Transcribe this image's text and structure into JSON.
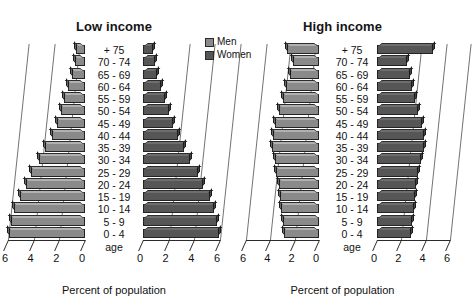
{
  "legend": {
    "items": [
      {
        "label": "Men",
        "color": "#8a8a8a"
      },
      {
        "label": "Women",
        "color": "#565656"
      }
    ]
  },
  "age_caption": "age",
  "axis_title": "Percent of population",
  "chart_data": {
    "type": "bar",
    "subtype": "population-pyramid",
    "xlabel": "Percent of population",
    "ylabel": "age",
    "xlim": [
      0,
      6
    ],
    "xticks": [
      6,
      4,
      2,
      0,
      0,
      2,
      4,
      6
    ],
    "grid": true,
    "legend_position": "top-center",
    "categories": [
      "+ 75",
      "70 - 74",
      "65 - 69",
      "60 - 64",
      "55 - 59",
      "50 - 54",
      "45 - 49",
      "40 - 44",
      "35 - 39",
      "30 - 34",
      "25 - 29",
      "20 - 24",
      "15 - 19",
      "10 - 14",
      "5 - 9",
      "0 - 4"
    ],
    "panels": [
      {
        "title": "Low income",
        "ticks_left": [
          6,
          4,
          2,
          0
        ],
        "ticks_right": [
          0,
          2,
          4,
          6
        ],
        "series": [
          {
            "name": "Men",
            "side": "left",
            "values": [
              0.7,
              0.8,
              1.0,
              1.3,
              1.6,
              1.9,
              2.2,
              2.6,
              3.1,
              3.6,
              4.2,
              4.6,
              5.1,
              5.5,
              5.8,
              5.9
            ]
          },
          {
            "name": "Women",
            "side": "right",
            "values": [
              0.8,
              0.9,
              1.1,
              1.4,
              1.7,
              2.0,
              2.3,
              2.7,
              3.2,
              3.7,
              4.3,
              4.7,
              5.2,
              5.5,
              5.8,
              5.9
            ]
          }
        ]
      },
      {
        "title": "High income",
        "ticks_left": [
          6,
          4,
          2,
          0
        ],
        "ticks_right": [
          0,
          2,
          4,
          6
        ],
        "series": [
          {
            "name": "Men",
            "side": "left",
            "values": [
              2.6,
              2.1,
              2.4,
              2.7,
              3.0,
              3.3,
              3.6,
              3.8,
              3.9,
              3.6,
              3.5,
              3.3,
              3.2,
              3.1,
              3.0,
              2.9
            ]
          },
          {
            "name": "Women",
            "side": "right",
            "values": [
              4.6,
              2.5,
              2.7,
              2.9,
              3.1,
              3.4,
              3.7,
              3.9,
              3.9,
              3.6,
              3.4,
              3.2,
              3.1,
              3.0,
              2.9,
              2.8
            ]
          }
        ]
      }
    ]
  }
}
